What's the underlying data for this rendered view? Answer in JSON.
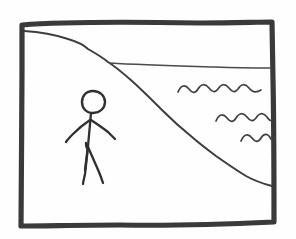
{
  "scene": {
    "title": "Hand-drawn sketch of a person standing on a shore beside water",
    "medium": "pencil-on-paper line drawing",
    "background_color": "#fefefe",
    "ink_color": "#2b2b2b",
    "canvas": {
      "width": 296,
      "height": 239
    }
  },
  "frame": {
    "name": "hand-drawn rectangular border",
    "stroke_color": "#3a3a3a",
    "stroke_width": 5.2,
    "corners": {
      "top_left": [
        22,
        24
      ],
      "top_right": [
        272,
        22
      ],
      "bottom_right": [
        274,
        222
      ],
      "bottom_left": [
        21,
        226
      ]
    },
    "path": "M 22,25 C 70,21 140,22 200,23 C 232,23 258,22 272,22 L 273,80 C 274,130 274,180 274,222 C 230,224 170,226 120,225 C 80,225 45,226 21,226 C 21,180 22,120 22,70 Z"
  },
  "terrain": {
    "name": "cliff-and-shoreline-diagonal",
    "description": "A ridge descending from upper-left, steepening into a diagonal shore that meets the right border low",
    "stroke_color": "#3d3d3d",
    "stroke_width": 2.0,
    "path": "M 24,31 C 40,32 56,35 68,39 C 78,42 84,45 88,49 C 95,53 102,57 108,62 C 116,67 124,74 132,81 C 142,90 152,100 162,110 C 172,120 182,129 192,137 C 200,144 208,150 216,156 C 226,163 236,170 246,176 C 255,181 264,184 272,186"
  },
  "horizon": {
    "name": "water-horizon-line",
    "description": "Thin line from the cliff edge running right to the frame border",
    "stroke_color": "#4a4a4a",
    "stroke_width": 1.5,
    "path": "M 110,63 C 140,65 180,66 215,67 C 240,68 258,68 271,68"
  },
  "waves": [
    {
      "name": "wave-line-top",
      "y": 88,
      "x_start": 178,
      "x_end": 262,
      "crests": 4,
      "path": "M 178,92 C 181,85 185,84 189,89 C 192,93 195,94 198,89 C 201,84 205,83 209,88 C 212,92 215,93 218,89 C 221,84 225,83 229,88 C 232,92 235,93 238,89 C 241,84 245,83 249,88 C 252,92 256,93 261,90"
    },
    {
      "name": "wave-line-middle",
      "y": 117,
      "x_start": 216,
      "x_end": 272,
      "crests": 3,
      "path": "M 216,121 C 219,114 223,113 227,118 C 230,122 233,123 236,118 C 239,113 243,112 247,117 C 250,121 253,122 256,118 C 259,113 263,112 267,117 C 269,120 271,122 272,119"
    },
    {
      "name": "wave-line-bottom",
      "y": 137,
      "x_start": 241,
      "x_end": 271,
      "crests": 2,
      "path": "M 241,141 C 244,134 248,133 252,138 C 255,142 258,143 261,138 C 264,133 268,133 271,139"
    }
  ],
  "figure": {
    "name": "stick-figure-person",
    "stroke_color": "#303030",
    "head": {
      "name": "figure-head",
      "shape": "hand-drawn oval",
      "center": [
        93,
        102
      ],
      "rx": 11,
      "ry": 11.5,
      "path": "M 93,91 C 100,91 105,96 105,102 C 105,108 100,113 93,113 C 86,113 82,108 82,102 C 82,96 86,91 93,91 Z"
    },
    "body": {
      "name": "figure-torso",
      "path": "M 91,113 C 90,124 89,136 88,146 C 87,154 86,162 85,170"
    },
    "arms": [
      {
        "name": "figure-left-arm",
        "path": "M 90,120 C 84,124 78,129 73,134 C 70,137 68,139 66,142"
      },
      {
        "name": "figure-right-arm",
        "path": "M 91,120 C 97,124 103,128 108,132 C 111,135 113,137 115,139"
      }
    ],
    "legs": [
      {
        "name": "figure-left-leg",
        "path": "M 88,146 C 87,156 86,166 85,174 C 84,179 83,182 83,184"
      },
      {
        "name": "figure-right-leg",
        "path": "M 88,147 C 92,156 96,165 99,172 C 101,177 102,180 103,183"
      }
    ],
    "hip_mark": {
      "name": "figure-hip-mark",
      "path": "M 86,143 C 86,145 86,147 87,148"
    }
  }
}
